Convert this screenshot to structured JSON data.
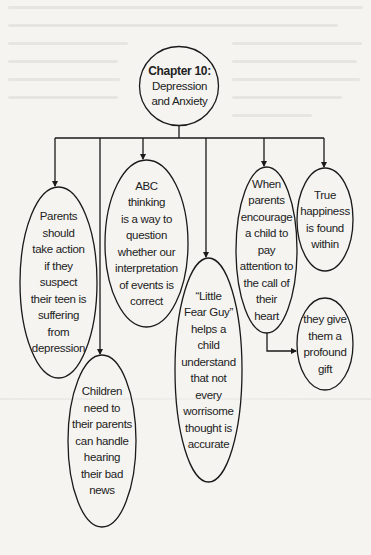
{
  "diagram": {
    "root": {
      "title": "Chapter 10:",
      "subtitle": "Depression\nand Anxiety"
    },
    "nodes": [
      {
        "id": "parents-action",
        "text": "Parents\nshould\ntake action\nif they\nsuspect\ntheir teen is\nsuffering\nfrom\ndepression"
      },
      {
        "id": "children-bad-news",
        "text": "Children\nneed to\ntheir parents\ncan handle\nhearing\ntheir bad\nnews"
      },
      {
        "id": "abc-thinking",
        "text": "ABC\nthinking\nis a way to\nquestion\nwhether our\ninterpretation\nof events is\ncorrect"
      },
      {
        "id": "little-fear-guy",
        "text": "“Little\nFear Guy”\nhelps a\nchild\nunderstand\nthat not\nevery\nworrisome\nthought is\naccurate"
      },
      {
        "id": "call-of-heart",
        "text": "When\nparents\nencourage\na child to\npay\nattention to\nthe call of\ntheir\nheart"
      },
      {
        "id": "true-happiness",
        "text": "True\nhappiness\nis found\nwithin"
      },
      {
        "id": "profound-gift",
        "text": "they give\nthem a\nprofound\ngift"
      }
    ],
    "edges": [
      {
        "from": "root",
        "to": "parents-action"
      },
      {
        "from": "root",
        "to": "children-bad-news"
      },
      {
        "from": "root",
        "to": "abc-thinking"
      },
      {
        "from": "root",
        "to": "little-fear-guy"
      },
      {
        "from": "root",
        "to": "call-of-heart"
      },
      {
        "from": "root",
        "to": "true-happiness"
      },
      {
        "from": "call-of-heart",
        "to": "profound-gift"
      }
    ],
    "colors": {
      "background": "#f5f4f1",
      "stroke": "#1a1a1a",
      "text": "#222222"
    }
  }
}
